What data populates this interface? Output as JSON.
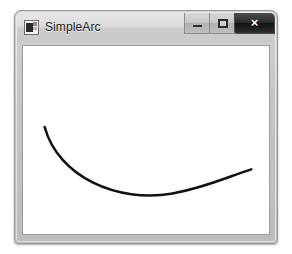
{
  "window": {
    "title": "SimpleArc",
    "app_icon": "application-icon",
    "frame_color": "#c4c4c4",
    "titlebar_color": "#dcdcdc"
  },
  "caption_buttons": {
    "minimize": {
      "label": "",
      "icon": "minimize-icon",
      "tooltip": "Minimize"
    },
    "maximize": {
      "label": "",
      "icon": "maximize-icon",
      "tooltip": "Maximize"
    },
    "close": {
      "label": "×",
      "icon": "close-icon",
      "tooltip": "Close",
      "color": "#1a1a1a"
    }
  },
  "canvas": {
    "background": "#ffffff",
    "shape_name": "arc",
    "stroke_color": "#111111",
    "stroke_width": 2.6,
    "path": "M 22 84 C 36 136, 96 163, 152 153 C 188 146, 212 134, 232 128",
    "view_box": "0 0 250 195"
  }
}
